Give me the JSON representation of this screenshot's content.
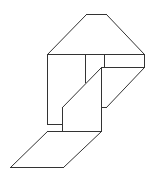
{
  "figure": {
    "stroke_color": "#333333",
    "background": "#ffffff",
    "segments": [
      {
        "name": "roof-top-edge",
        "points": [
          [
            86,
            14
          ],
          [
            106,
            14
          ]
        ]
      },
      {
        "name": "roof-left-slope",
        "points": [
          [
            86,
            14
          ],
          [
            47,
            54
          ]
        ]
      },
      {
        "name": "roof-right-slope",
        "points": [
          [
            106,
            14
          ],
          [
            144,
            54
          ]
        ]
      },
      {
        "name": "roof-base-edge",
        "points": [
          [
            47,
            54
          ],
          [
            144,
            54
          ]
        ]
      },
      {
        "name": "left-wall-edge",
        "points": [
          [
            47,
            54
          ],
          [
            47,
            124
          ]
        ]
      },
      {
        "name": "left-notch-top",
        "points": [
          [
            47,
            124
          ],
          [
            62,
            124
          ]
        ]
      },
      {
        "name": "inner-vertical-left",
        "points": [
          [
            85,
            54
          ],
          [
            85,
            82
          ]
        ]
      },
      {
        "name": "inner-vertical-right",
        "points": [
          [
            104,
            54
          ],
          [
            104,
            67
          ]
        ]
      },
      {
        "name": "right-wall-edge",
        "points": [
          [
            144,
            54
          ],
          [
            144,
            67
          ]
        ]
      },
      {
        "name": "shelf-back-edge",
        "points": [
          [
            101,
            67
          ],
          [
            144,
            67
          ]
        ]
      },
      {
        "name": "shelf-right-slope",
        "points": [
          [
            144,
            67
          ],
          [
            106,
            107
          ]
        ]
      },
      {
        "name": "shelf-step",
        "points": [
          [
            101,
            107
          ],
          [
            106,
            107
          ]
        ]
      },
      {
        "name": "front-panel-slope",
        "points": [
          [
            101,
            67
          ],
          [
            62,
            107
          ]
        ]
      },
      {
        "name": "front-panel-left",
        "points": [
          [
            62,
            107
          ],
          [
            62,
            131
          ]
        ]
      },
      {
        "name": "front-panel-right",
        "points": [
          [
            101,
            67
          ],
          [
            101,
            131
          ]
        ]
      },
      {
        "name": "base-top-edge",
        "points": [
          [
            47,
            131
          ],
          [
            101,
            131
          ]
        ]
      },
      {
        "name": "floor-left-slope",
        "points": [
          [
            47,
            131
          ],
          [
            10,
            167
          ]
        ]
      },
      {
        "name": "floor-right-slope",
        "points": [
          [
            101,
            131
          ],
          [
            63,
            167
          ]
        ]
      },
      {
        "name": "floor-bottom-edge",
        "points": [
          [
            10,
            167
          ],
          [
            63,
            167
          ]
        ]
      }
    ]
  }
}
